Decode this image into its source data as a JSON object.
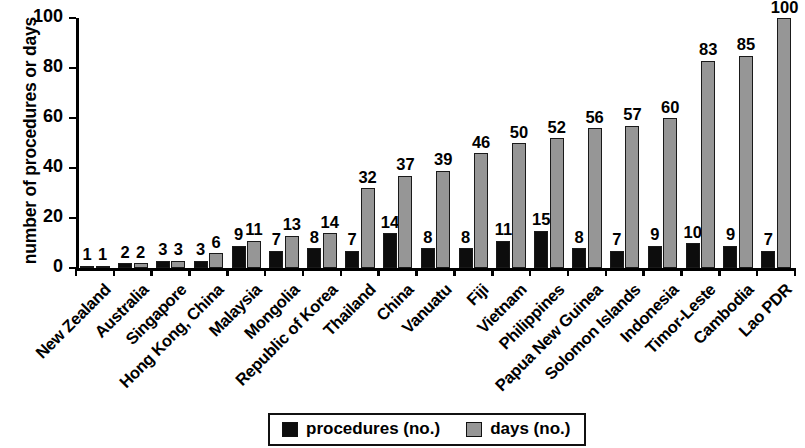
{
  "chart_data": {
    "type": "bar",
    "title": "",
    "subtitle": "",
    "xlabel": "",
    "ylabel": "number of procedures or days",
    "ylim": [
      0,
      100
    ],
    "yticks": [
      0,
      20,
      40,
      60,
      80,
      100
    ],
    "grid": false,
    "legend_position": "bottom-center",
    "categories": [
      "New Zealand",
      "Australia",
      "Singapore",
      "Hong Kong, China",
      "Malaysia",
      "Mongolia",
      "Republic of Korea",
      "Thailand",
      "China",
      "Vanuatu",
      "Fiji",
      "Vietnam",
      "Philippines",
      "Papua New Guinea",
      "Solomon Islands",
      "Indonesia",
      "Timor-Leste",
      "Cambodia",
      "Lao PDR"
    ],
    "series": [
      {
        "name": "procedures (no.)",
        "color": "#0d0d0d",
        "values": [
          1,
          2,
          3,
          3,
          9,
          7,
          8,
          7,
          14,
          8,
          8,
          11,
          15,
          8,
          7,
          9,
          10,
          9,
          7
        ]
      },
      {
        "name": "days (no.)",
        "color": "#969696",
        "values": [
          1,
          2,
          3,
          6,
          11,
          13,
          14,
          32,
          37,
          39,
          46,
          50,
          52,
          56,
          57,
          60,
          83,
          85,
          100
        ]
      }
    ]
  },
  "legend": {
    "items": [
      {
        "label": "procedures (no.)",
        "swatch": "procedures"
      },
      {
        "label": "days (no.)",
        "swatch": "days"
      }
    ]
  }
}
